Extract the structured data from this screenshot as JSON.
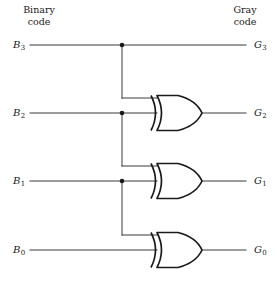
{
  "figure": {
    "title_semantic": "binary-to-gray-code-converter",
    "background": "#ffffff",
    "line_color": "#3a3a3a",
    "gate_color": "#1a1a1a",
    "headers": {
      "binary_line1": "Binary",
      "binary_line2": "code",
      "gray_line1": "Gray",
      "gray_line2": "code"
    },
    "inputs": [
      {
        "id": "B3",
        "letter": "B",
        "sub": "3",
        "y": 45
      },
      {
        "id": "B2",
        "letter": "B",
        "sub": "2",
        "y": 113
      },
      {
        "id": "B1",
        "letter": "B",
        "sub": "1",
        "y": 181
      },
      {
        "id": "B0",
        "letter": "B",
        "sub": "0",
        "y": 250
      }
    ],
    "outputs": [
      {
        "id": "G3",
        "letter": "G",
        "sub": "3",
        "y": 45
      },
      {
        "id": "G2",
        "letter": "G",
        "sub": "2",
        "y": 113
      },
      {
        "id": "G1",
        "letter": "G",
        "sub": "1",
        "y": 181
      },
      {
        "id": "G0",
        "letter": "G",
        "sub": "0",
        "y": 250
      }
    ],
    "gates": [
      {
        "name": "xor-gate-1",
        "type": "XOR",
        "output": "G2",
        "inputs": [
          "B3",
          "B2"
        ]
      },
      {
        "name": "xor-gate-2",
        "type": "XOR",
        "output": "G1",
        "inputs": [
          "B2",
          "B1"
        ]
      },
      {
        "name": "xor-gate-3",
        "type": "XOR",
        "output": "G0",
        "inputs": [
          "B1",
          "B0"
        ]
      }
    ],
    "junctions": [
      {
        "name": "junction-b3",
        "x": 122,
        "y": 45
      },
      {
        "name": "junction-b2",
        "x": 122,
        "y": 113
      },
      {
        "name": "junction-b1",
        "x": 122,
        "y": 181
      }
    ]
  }
}
